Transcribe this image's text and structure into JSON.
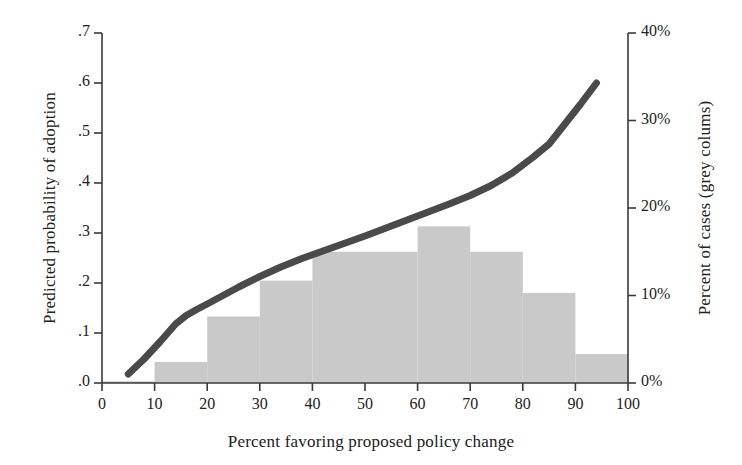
{
  "chart_data": {
    "type": "bar",
    "title": "",
    "subtitle": "",
    "xlabel": "Percent favoring proposed policy change",
    "ylabel": "Predicted probability of adoption",
    "ylabel_right": "Percent of cases (grey colums)",
    "xlim": [
      0,
      100
    ],
    "ylim": [
      0.0,
      0.7
    ],
    "ylim_right": [
      0,
      40
    ],
    "grid": false,
    "legend": null,
    "xticks": [
      0,
      10,
      20,
      30,
      40,
      50,
      60,
      70,
      80,
      90,
      100
    ],
    "xtick_labels": [
      "0",
      "10",
      "20",
      "30",
      "40",
      "50",
      "60",
      "70",
      "80",
      "90",
      "100"
    ],
    "yticks": [
      0.0,
      0.1,
      0.2,
      0.3,
      0.4,
      0.5,
      0.6,
      0.7
    ],
    "ytick_labels": [
      ".0",
      ".1",
      ".2",
      ".3",
      ".4",
      ".5",
      ".6",
      ".7"
    ],
    "yticks_right": [
      0,
      10,
      20,
      30,
      40
    ],
    "ytick_labels_right": [
      "0%",
      "10%",
      "20%",
      "30%",
      "40%"
    ],
    "series": [
      {
        "name": "Percent of cases (grey colums)",
        "type": "bar",
        "axis": "right",
        "color": "#c9c9c9",
        "bin_edges": [
          0,
          10,
          20,
          30,
          40,
          50,
          60,
          70,
          80,
          90,
          100
        ],
        "categories": [
          "0-10",
          "10-20",
          "20-30",
          "30-40",
          "40-50",
          "50-60",
          "60-70",
          "70-80",
          "80-90",
          "90-100"
        ],
        "values": [
          0.2,
          2.4,
          7.6,
          11.7,
          15.0,
          15.0,
          17.9,
          15.0,
          10.3,
          3.3
        ]
      },
      {
        "name": "Predicted probability of adoption",
        "type": "line",
        "axis": "left",
        "color": "#4a4a4a",
        "x": [
          5,
          8,
          11,
          14,
          16,
          18,
          20,
          23,
          26,
          30,
          34,
          38,
          42,
          46,
          50,
          54,
          58,
          62,
          66,
          70,
          74,
          78,
          82,
          85,
          88,
          91,
          94
        ],
        "y": [
          0.018,
          0.048,
          0.082,
          0.118,
          0.135,
          0.147,
          0.158,
          0.175,
          0.192,
          0.213,
          0.232,
          0.249,
          0.264,
          0.279,
          0.294,
          0.31,
          0.326,
          0.342,
          0.358,
          0.375,
          0.395,
          0.42,
          0.452,
          0.478,
          0.518,
          0.558,
          0.6
        ]
      }
    ],
    "colors": {
      "bar_fill": "#c9c9c9",
      "line": "#4a4a4a",
      "axis": "#3a3a3a",
      "text": "#1a1a1a",
      "background": "#ffffff"
    }
  },
  "axes": {
    "left_title": "Predicted probability of adoption",
    "right_title": "Percent of cases (grey colums)",
    "bottom_title": "Percent favoring proposed policy change"
  }
}
